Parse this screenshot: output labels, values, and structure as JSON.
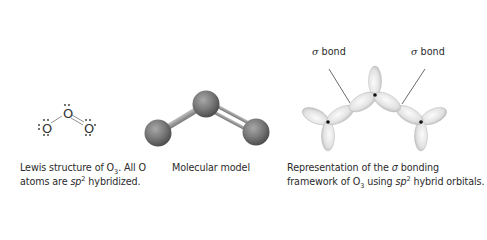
{
  "panels": [
    {
      "id": "lewis",
      "title": "Lewis structure",
      "atoms": [
        "O",
        "O",
        "O"
      ],
      "caption": {
        "line1_pre": "Lewis structure of O",
        "line1_sub": "3",
        "line1_post": ". All O",
        "line2_pre": "atoms are ",
        "line2_ital": "sp",
        "line2_sup": "2",
        "line2_post": " hybridized."
      }
    },
    {
      "id": "model",
      "title": "Molecular model",
      "caption": {
        "text": "Molecular model"
      }
    },
    {
      "id": "orbital",
      "title": "Sigma bonding framework",
      "labels": [
        {
          "symbol": "σ",
          "text": " bond"
        },
        {
          "symbol": "σ",
          "text": " bond"
        }
      ],
      "caption": {
        "line1_pre": "Representation of the ",
        "line1_sym": "σ",
        "line1_post": " bonding",
        "line2_pre": "framework of O",
        "line2_sub": "3",
        "line2_mid": " using ",
        "line2_ital": "sp",
        "line2_sup": "2",
        "line2_post": " hybrid orbitals."
      }
    }
  ],
  "colors": {
    "sphere_base": "#6e6e6e",
    "sphere_highlight": "#a8a8a8",
    "bond_rod": "#9a9a9a",
    "orbital_fill": "#e8e8e8",
    "orbital_shadow": "#b5b5b5",
    "text": "#2b2b2b"
  }
}
